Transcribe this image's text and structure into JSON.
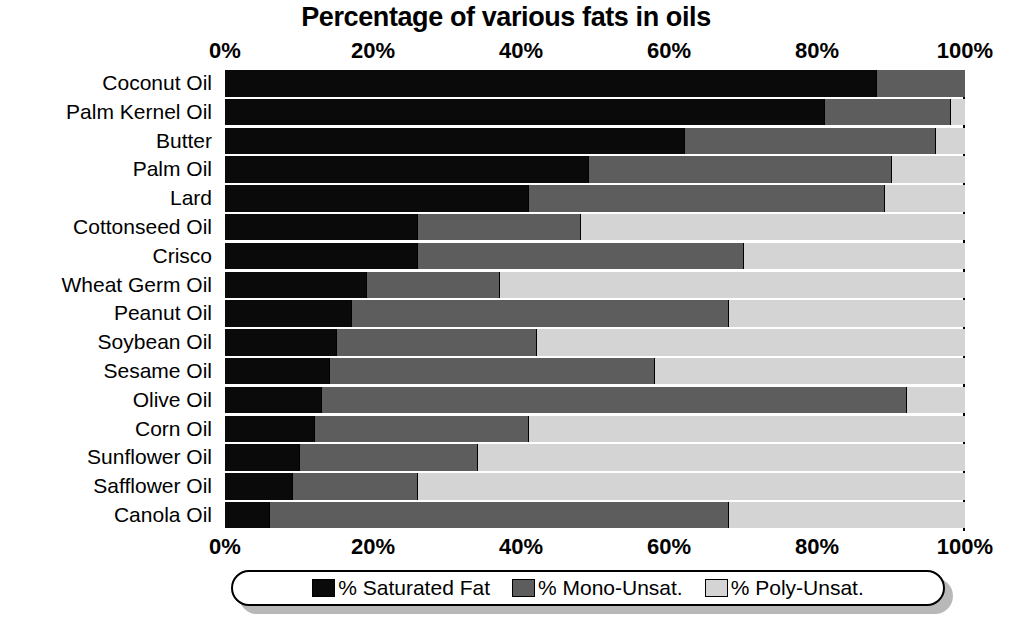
{
  "chart_data": {
    "type": "bar",
    "orientation": "horizontal",
    "stacked": true,
    "title": "Percentage of various fats in oils",
    "xlabel": "",
    "ylabel": "",
    "xlim": [
      0,
      100
    ],
    "grid": false,
    "legend_position": "bottom",
    "tick_labels": [
      "0%",
      "20%",
      "40%",
      "60%",
      "80%",
      "100%"
    ],
    "tick_values": [
      0,
      20,
      40,
      60,
      80,
      100
    ],
    "categories": [
      "Coconut Oil",
      "Palm Kernel Oil",
      "Butter",
      "Palm Oil",
      "Lard",
      "Cottonseed Oil",
      "Crisco",
      "Wheat Germ Oil",
      "Peanut Oil",
      "Soybean Oil",
      "Sesame Oil",
      "Olive Oil",
      "Corn Oil",
      "Sunflower Oil",
      "Safflower Oil",
      "Canola Oil"
    ],
    "series": [
      {
        "name": "% Saturated Fat",
        "color": "#0a0a0a",
        "values": [
          88,
          81,
          62,
          49,
          41,
          26,
          26,
          19,
          17,
          15,
          14,
          13,
          12,
          10,
          9,
          6
        ]
      },
      {
        "name": "% Mono-Unsat.",
        "color": "#5d5d5d",
        "values": [
          12,
          17,
          34,
          41,
          48,
          22,
          44,
          18,
          51,
          27,
          44,
          79,
          29,
          24,
          17,
          62
        ]
      },
      {
        "name": "% Poly-Unsat.",
        "color": "#d4d4d4",
        "values": [
          0,
          2,
          4,
          10,
          11,
          52,
          30,
          63,
          32,
          58,
          42,
          8,
          59,
          66,
          74,
          32
        ]
      }
    ]
  },
  "legend": {
    "items": [
      {
        "label": "% Saturated Fat",
        "swatch": "sat"
      },
      {
        "label": "% Mono-Unsat.",
        "swatch": "mono"
      },
      {
        "label": "% Poly-Unsat.",
        "swatch": "poly"
      }
    ]
  },
  "colors": {
    "saturated": "#0a0a0a",
    "mono_unsat": "#5d5d5d",
    "poly_unsat": "#d4d4d4",
    "background": "#ffffff",
    "text": "#000000"
  }
}
